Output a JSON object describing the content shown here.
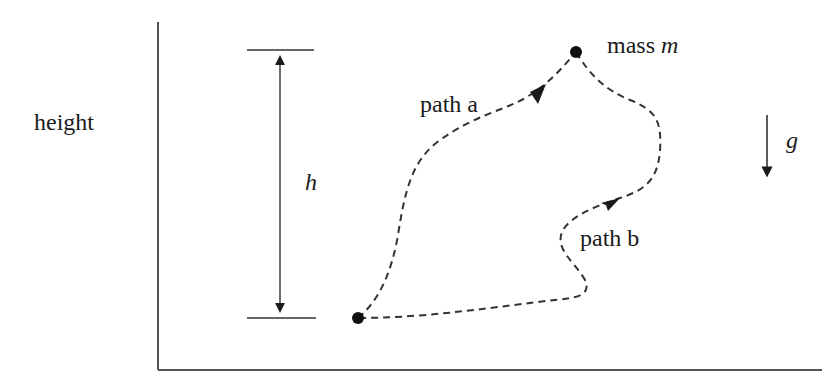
{
  "figure": {
    "type": "physics-diagram",
    "axis_label": "height",
    "height_label": "h",
    "mass_label_prefix": "mass ",
    "mass_symbol": "m",
    "gravity_symbol": "g",
    "paths": [
      {
        "name": "path a",
        "label": "path a"
      },
      {
        "name": "path b",
        "label": "path b"
      }
    ],
    "colors": {
      "ink": "#1a1a1a",
      "axis": "#555555",
      "background": "#ffffff"
    }
  }
}
